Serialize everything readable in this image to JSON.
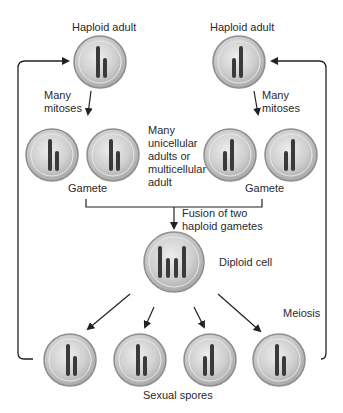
{
  "diagram": {
    "labels": {
      "haploid_adult_left": "Haploid adult",
      "haploid_adult_right": "Haploid adult",
      "mitoses_left": [
        "Many",
        "mitoses"
      ],
      "mitoses_right": [
        "Many",
        "mitoses"
      ],
      "middle_note": [
        "Many",
        "unicellular",
        "adults or",
        "multicellular",
        "adult"
      ],
      "gamete_left": "Gamete",
      "gamete_right": "Gamete",
      "fusion": [
        "Fusion of two",
        "haploid gametes"
      ],
      "diploid": "Diploid cell",
      "meiosis": "Meiosis",
      "spores": "Sexual spores"
    },
    "colors": {
      "cell_fill": "#cfcfcf",
      "cell_rim": "#9a9a9a",
      "chromosome": "#3a3a3a",
      "arrow": "#222222"
    }
  }
}
